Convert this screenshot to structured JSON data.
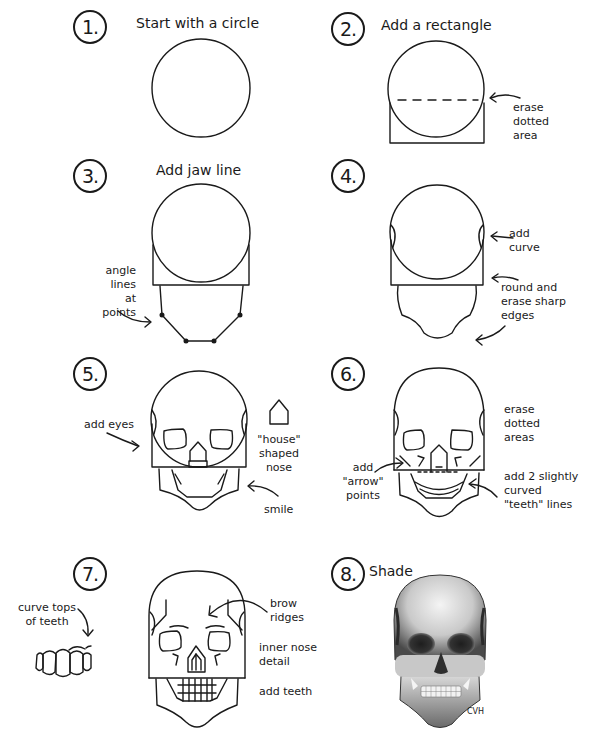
{
  "steps": [
    {
      "number": "1.",
      "title": "Start with a circle",
      "labels": []
    },
    {
      "number": "2.",
      "title": "Add a rectangle",
      "labels": [
        "erase\ndotted\narea"
      ]
    },
    {
      "number": "3.",
      "title": "Add jaw line",
      "labels": [
        "angle\nlines\nat points"
      ]
    },
    {
      "number": "4.",
      "title": "",
      "labels": [
        "add\ncurve",
        "round and\nerase sharp\nedges"
      ]
    },
    {
      "number": "5.",
      "title": "",
      "labels": [
        "add eyes",
        "\"house\"\nshaped\nnose",
        "smile"
      ]
    },
    {
      "number": "6.",
      "title": "",
      "labels": [
        "erase\ndotted\nareas",
        "add\n\"arrow\"\npoints",
        "add 2 slightly\ncurved\n\"teeth\" lines"
      ]
    },
    {
      "number": "7.",
      "title": "",
      "labels": [
        "curve tops\nof teeth",
        "brow\nridges",
        "inner nose\ndetail",
        "add teeth"
      ]
    },
    {
      "number": "8.",
      "title": "Shade",
      "labels": []
    }
  ],
  "signature": "CVH",
  "colors": {
    "ink": "#1a1a1a",
    "paper": "#ffffff"
  }
}
